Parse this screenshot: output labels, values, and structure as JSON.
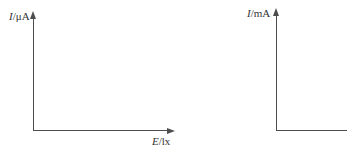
{
  "background": "#ffffff",
  "axis_color": "#4d4d4d",
  "text_color": "#333333",
  "chart_data": [
    {
      "id": "left",
      "type": "line",
      "title": "",
      "xlabel": "E/lx",
      "ylabel": "I/μA",
      "xlabel_parts": {
        "quantity": "E",
        "unit": "/lx"
      },
      "ylabel_parts": {
        "quantity": "I",
        "unit": "/μA"
      },
      "series": [],
      "categories": [],
      "axes": {
        "x_arrow": true,
        "y_arrow": true,
        "ticks": "none",
        "grid": false
      },
      "note": "empty coordinate system, no data plotted, no tick marks or numeric scale"
    },
    {
      "id": "right",
      "type": "line",
      "title": "",
      "xlabel": "",
      "ylabel": "I/mA",
      "ylabel_parts": {
        "quantity": "I",
        "unit": "/mA"
      },
      "series": [],
      "categories": [],
      "axes": {
        "x_arrow": false,
        "y_arrow": true,
        "ticks": "none",
        "grid": false
      },
      "note": "empty coordinate system, x-axis runs off the right edge of the image, its label not visible"
    }
  ]
}
